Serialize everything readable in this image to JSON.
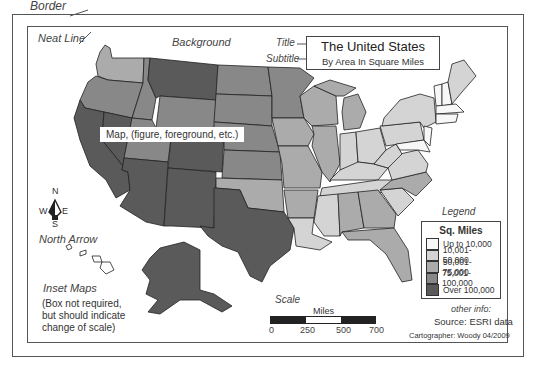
{
  "labels": {
    "border": "Border",
    "neat_line": "Neat Line",
    "background": "Background",
    "title": "Title",
    "subtitle": "Subtitle",
    "map": "Map, (figure, foreground, etc.)",
    "north_arrow": "North Arrow",
    "inset_maps": "Inset Maps",
    "inset_note_1": "(Box not required,",
    "inset_note_2": "but should indicate",
    "inset_note_3": "change of scale)",
    "legend": "Legend",
    "scale": "Scale",
    "other_info": "other info:"
  },
  "map_title": {
    "title": "The United States",
    "subtitle": "By  Area In Square Miles"
  },
  "compass": {
    "n": "N",
    "s": "S",
    "e": "E",
    "w": "W"
  },
  "legend": {
    "heading": "Sq. Miles",
    "items": [
      {
        "label": "Up to 10,000",
        "color": "#f7f7f7"
      },
      {
        "label": "10,001-50,000",
        "color": "#d4d4d4"
      },
      {
        "label": "50,001-75,000",
        "color": "#ababab"
      },
      {
        "label": "75,001-100,000",
        "color": "#888888"
      },
      {
        "label": "Over 100,000",
        "color": "#5a5a5a"
      }
    ]
  },
  "scale_bar": {
    "unit": "Miles",
    "ticks": [
      "0",
      "250",
      "500",
      "700"
    ],
    "segments": [
      "#222222",
      "#ffffff",
      "#222222"
    ]
  },
  "source": "Source: ESRI data",
  "cartographer": "Cartographer: Woody 04/2009",
  "colors": {
    "class1": "#f7f7f7",
    "class2": "#d4d4d4",
    "class3": "#ababab",
    "class4": "#888888",
    "class5": "#5a5a5a",
    "outline": "#222222"
  }
}
